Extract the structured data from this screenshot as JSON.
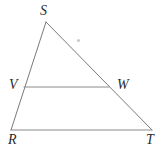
{
  "figure": {
    "type": "geometry-diagram",
    "shape": "triangle-with-midsegment",
    "background_color": "#ffffff",
    "stroke_color": "#7a7a7a",
    "stroke_width": 1,
    "label_color": "#2b2b2b",
    "width": 163,
    "height": 158,
    "points": {
      "S": {
        "label": "S",
        "x": 46,
        "y": 22
      },
      "R": {
        "label": "R",
        "x": 11,
        "y": 130
      },
      "T": {
        "label": "T",
        "x": 152,
        "y": 130
      },
      "V": {
        "label": "V",
        "x": 24,
        "y": 87
      },
      "W": {
        "label": "W",
        "x": 109,
        "y": 87
      }
    },
    "segments": [
      {
        "name": "SR",
        "from": "S",
        "to": "R"
      },
      {
        "name": "ST",
        "from": "S",
        "to": "T"
      },
      {
        "name": "RT",
        "from": "R",
        "to": "T"
      },
      {
        "name": "VW",
        "from": "V",
        "to": "W"
      }
    ],
    "artifacts": [
      {
        "name": "stray-dot",
        "x": 78,
        "y": 40,
        "color": "#c9c9c9"
      }
    ]
  }
}
